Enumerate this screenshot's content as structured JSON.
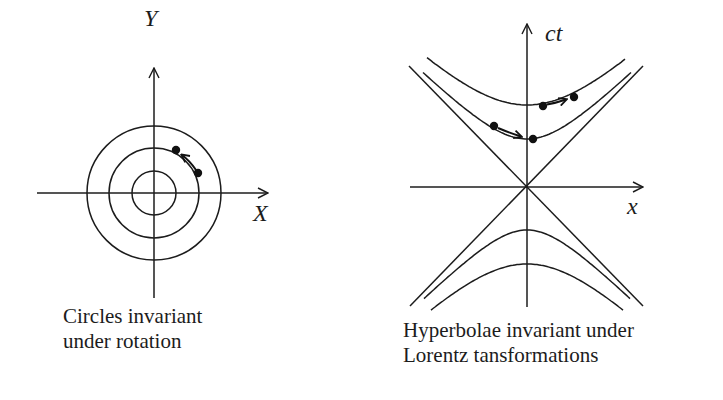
{
  "left_diagram": {
    "y_axis_label": "Y",
    "x_axis_label": "X",
    "caption_line1": "Circles invariant",
    "caption_line2": "under rotation",
    "origin": [
      154,
      193
    ],
    "circle_radii": [
      22,
      45,
      67
    ],
    "points": [
      [
        176,
        150
      ],
      [
        198,
        173
      ]
    ],
    "arrow_direction": "counterclockwise"
  },
  "right_diagram": {
    "y_axis_label": "ct",
    "x_axis_label": "x",
    "caption_line1": "Hyperbolae invariant under",
    "caption_line2": "Lorentz tansformations",
    "origin": [
      527,
      187
    ],
    "upper_hyperbola_vertices": [
      105,
      139
    ],
    "lower_hyperbola_vertices": [
      230,
      264
    ],
    "points_upper_outer": [
      [
        543,
        106
      ],
      [
        574,
        97
      ]
    ],
    "points_upper_inner": [
      [
        494,
        126
      ],
      [
        533,
        139
      ]
    ],
    "light_cone": "diagonal lines through origin"
  },
  "colors": {
    "stroke": "#1c1c1c",
    "background": "#ffffff"
  }
}
